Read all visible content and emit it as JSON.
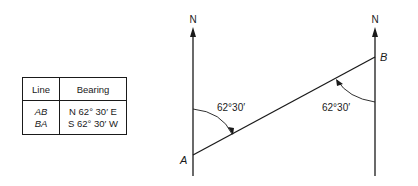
{
  "table": {
    "headers": [
      "Line",
      "Bearing"
    ],
    "rows": [
      {
        "line": "AB",
        "bearing": "N 62° 30′ E"
      },
      {
        "line": "BA",
        "bearing": "S 62° 30′ W"
      }
    ]
  },
  "diagram": {
    "north_left": "N",
    "north_right": "N",
    "point_a": "A",
    "point_b": "B",
    "angle_left": "62°30′",
    "angle_right": "62°30′"
  }
}
